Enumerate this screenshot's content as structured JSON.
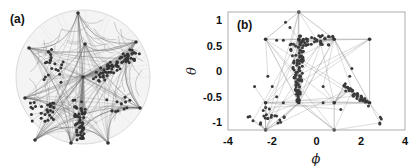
{
  "figure": {
    "panel_a": {
      "label": "(a)",
      "description": "Network embedded in hyperbolic disk (Poincare disk) with hub nodes and arc-shaped edges"
    },
    "panel_b": {
      "label": "(b)",
      "xlabel": "ϕ",
      "ylabel": "θ",
      "xticks": [
        "-4",
        "-2",
        "0",
        "2",
        "4"
      ],
      "yticks": [
        "1",
        "0.5",
        "0",
        "-0.5",
        "-1"
      ]
    }
  },
  "chart_data": [
    {
      "type": "network",
      "title": "(a)",
      "layout": "disk",
      "disk": {
        "cx": 83,
        "cy": 77,
        "r": 67
      },
      "hubs_px": [
        [
          78,
          13
        ],
        [
          29,
          48
        ],
        [
          85,
          44
        ],
        [
          136,
          42
        ],
        [
          83,
          77
        ],
        [
          25,
          98
        ],
        [
          71,
          143
        ],
        [
          108,
          143
        ],
        [
          140,
          108
        ],
        [
          35,
          140
        ]
      ]
    },
    {
      "type": "scatter",
      "title": "(b)",
      "xlabel": "ϕ",
      "ylabel": "θ",
      "xlim": [
        -4,
        4
      ],
      "ylim": [
        -1.15,
        1.15
      ],
      "xticks": [
        -4,
        -2,
        0,
        2,
        4
      ],
      "yticks": [
        -1,
        -0.5,
        0,
        0.5,
        1
      ],
      "grid": false,
      "hub_nodes": [
        {
          "x": -0.8,
          "y": 1.15
        },
        {
          "x": -2.3,
          "y": 0.62
        },
        {
          "x": -0.8,
          "y": 0.62
        },
        {
          "x": 0.8,
          "y": 0.62
        },
        {
          "x": 2.4,
          "y": 0.62
        },
        {
          "x": -2.3,
          "y": -0.62
        },
        {
          "x": -0.8,
          "y": -0.62
        },
        {
          "x": 0.8,
          "y": -0.62
        },
        {
          "x": 2.4,
          "y": -0.62
        },
        {
          "x": -2.3,
          "y": -1.15
        },
        {
          "x": 0.8,
          "y": -1.15
        }
      ],
      "clusters": [
        {
          "name": "central-wedge",
          "x_range": [
            -1.2,
            -0.5
          ],
          "y_range": [
            -0.6,
            0.6
          ]
        },
        {
          "name": "upper-ridge",
          "x_range": [
            -0.8,
            0.8
          ],
          "y_range": [
            0.5,
            0.7
          ]
        },
        {
          "name": "right-lower",
          "x_range": [
            1.2,
            2.4
          ],
          "y_range": [
            -0.75,
            -0.3
          ]
        },
        {
          "name": "left-lower",
          "x_range": [
            -3.1,
            -1.3
          ],
          "y_range": [
            -1.05,
            -0.7
          ]
        },
        {
          "name": "far-right",
          "x_range": [
            2.8,
            3.1
          ],
          "y_range": [
            -1.05,
            -0.9
          ]
        }
      ]
    }
  ]
}
